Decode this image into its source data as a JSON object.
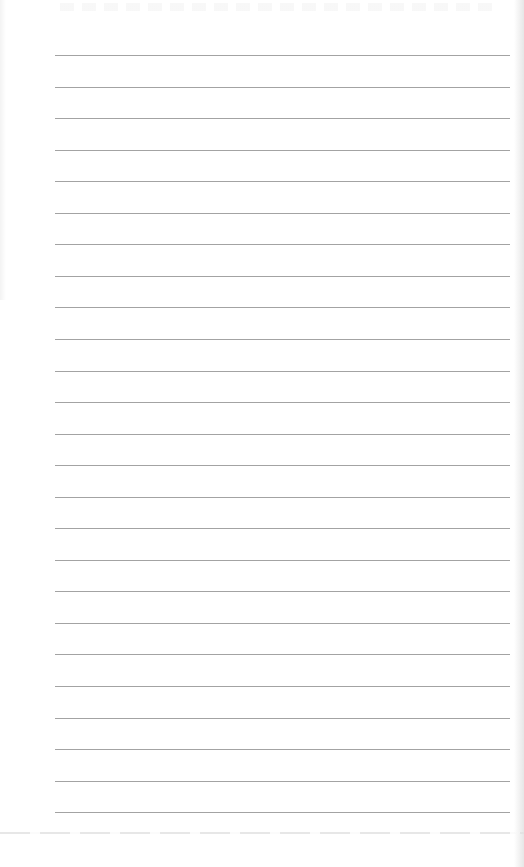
{
  "document": {
    "type": "ruled-notebook-page",
    "background_color": "#ffffff",
    "rule_color": "#a3a3a3",
    "rule_count": 25,
    "rule_left_x": 55,
    "rule_right_x": 510,
    "first_rule_y": 55,
    "rule_spacing": 31.55,
    "text_content": ""
  }
}
